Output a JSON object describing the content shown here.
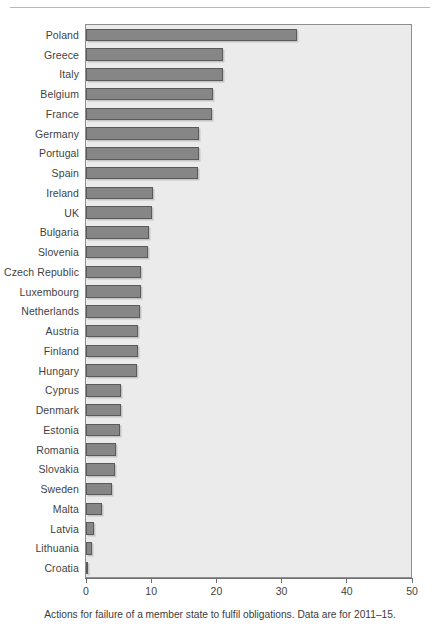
{
  "figure": {
    "top_rule_label": "",
    "caption": "Actions for failure of a member state to fulfil obligations. Data are for 2011–15."
  },
  "colors": {
    "bar_fill": "#868686",
    "bar_border": "#5a5a5a",
    "plot_background": "#ebebeb",
    "frame": "#8e8e8e",
    "text": "#3b3b3b"
  },
  "chart_data": {
    "type": "bar",
    "orientation": "horizontal",
    "title": "",
    "subtitle": "",
    "xlabel": "",
    "ylabel": "",
    "xlim": [
      0,
      50
    ],
    "xticks": [
      0,
      10,
      20,
      30,
      40,
      50
    ],
    "xtick_labels": [
      "0",
      "10",
      "20",
      "30",
      "40",
      "50"
    ],
    "grid": false,
    "legend": null,
    "annotations": [
      "Actions for failure of a member state to fulfil obligations. Data are for 2011–15."
    ],
    "categories": [
      "Poland",
      "Greece",
      "Italy",
      "Belgium",
      "France",
      "Germany",
      "Portugal",
      "Spain",
      "Ireland",
      "UK",
      "Bulgaria",
      "Slovenia",
      "Czech Republic",
      "Luxembourg",
      "Netherlands",
      "Austria",
      "Finland",
      "Hungary",
      "Cyprus",
      "Denmark",
      "Estonia",
      "Romania",
      "Slovakia",
      "Sweden",
      "Malta",
      "Latvia",
      "Lithuania",
      "Croatia"
    ],
    "values": [
      32.4,
      21.0,
      21.0,
      19.5,
      19.4,
      17.4,
      17.3,
      17.2,
      10.2,
      10.1,
      9.6,
      9.5,
      8.5,
      8.4,
      8.3,
      8.0,
      7.9,
      7.8,
      5.4,
      5.3,
      5.2,
      4.6,
      4.4,
      4.0,
      2.5,
      1.3,
      0.9,
      0.2
    ]
  }
}
